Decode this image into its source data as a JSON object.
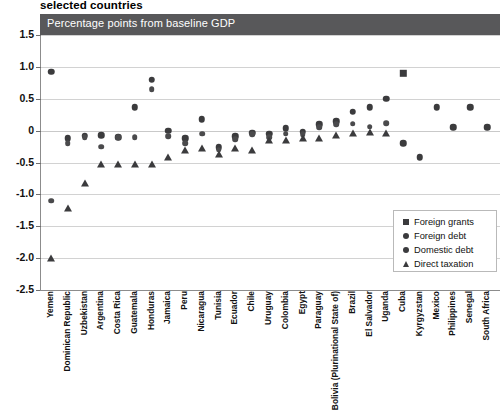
{
  "header": {
    "supertitle": "selected countries",
    "banner_label": "Percentage points from baseline GDP"
  },
  "chart_data": {
    "type": "scatter",
    "title": "selected countries",
    "subtitle": "Percentage points from baseline GDP",
    "xlabel": "",
    "ylabel": "Percentage points from baseline GDP",
    "ylim": [
      -2.5,
      1.5
    ],
    "yticks": [
      1.5,
      1.0,
      0.5,
      0,
      -0.5,
      -1.0,
      -1.5,
      -2.0,
      -2.5
    ],
    "ytick_labels": [
      "1.5",
      "1.0",
      "0.5",
      "0",
      "-0.5",
      "-1.0",
      "-1.5",
      "-2.0",
      "-2.5"
    ],
    "grid": true,
    "legend_position": "bottom-right",
    "categories": [
      "Yemen",
      "Dominican Republic",
      "Uzbekistan",
      "Argentina",
      "Costa Rica",
      "Guatemala",
      "Honduras",
      "Jamaica",
      "Peru",
      "Nicaragua",
      "Tunisia",
      "Ecuador",
      "Chile",
      "Uruguay",
      "Colombia",
      "Egypt",
      "Paraguay",
      "Bolivia (Plurinational State of)",
      "Brazil",
      "El Salvador",
      "Uganda",
      "Cuba",
      "Kyrgyzstan",
      "Mexico",
      "Philippines",
      "Senegal",
      "South Africa"
    ],
    "series": [
      {
        "name": "Foreign grants",
        "marker": "square",
        "values": [
          null,
          null,
          null,
          null,
          null,
          null,
          null,
          null,
          null,
          null,
          null,
          null,
          null,
          null,
          null,
          null,
          null,
          null,
          null,
          null,
          null,
          0.9,
          null,
          null,
          null,
          null,
          null
        ]
      },
      {
        "name": "Foreign debt",
        "marker": "circle",
        "values": [
          0.92,
          -0.12,
          -0.08,
          -0.07,
          -0.1,
          0.37,
          0.8,
          0.0,
          -0.12,
          0.18,
          -0.26,
          -0.09,
          -0.03,
          -0.05,
          0.04,
          -0.02,
          0.1,
          0.15,
          0.3,
          0.37,
          0.5,
          -0.2,
          -0.42,
          0.37,
          0.05,
          0.37,
          0.05
        ]
      },
      {
        "name": "Domestic debt",
        "marker": "circle",
        "values": [
          -1.1,
          -0.2,
          -0.1,
          -0.25,
          -0.1,
          -0.1,
          0.65,
          -0.09,
          -0.2,
          -0.05,
          -0.3,
          -0.13,
          -0.06,
          -0.1,
          -0.05,
          -0.06,
          0.05,
          0.1,
          0.11,
          0.06,
          0.12,
          null,
          null,
          null,
          null,
          null,
          null
        ]
      },
      {
        "name": "Direct taxation",
        "marker": "triangle",
        "values": [
          -2.0,
          -1.22,
          -0.82,
          -0.53,
          -0.52,
          -0.52,
          -0.52,
          -0.42,
          -0.3,
          -0.27,
          -0.36,
          -0.27,
          -0.3,
          -0.14,
          -0.14,
          -0.12,
          -0.12,
          -0.07,
          -0.04,
          -0.02,
          -0.03,
          null,
          null,
          null,
          null,
          null,
          null
        ]
      }
    ]
  },
  "legend": {
    "items": [
      {
        "label": "Foreign grants",
        "marker": "square"
      },
      {
        "label": "Foreign debt",
        "marker": "circle"
      },
      {
        "label": "Domestic debt",
        "marker": "circle"
      },
      {
        "label": "Direct taxation",
        "marker": "triangle"
      }
    ]
  }
}
